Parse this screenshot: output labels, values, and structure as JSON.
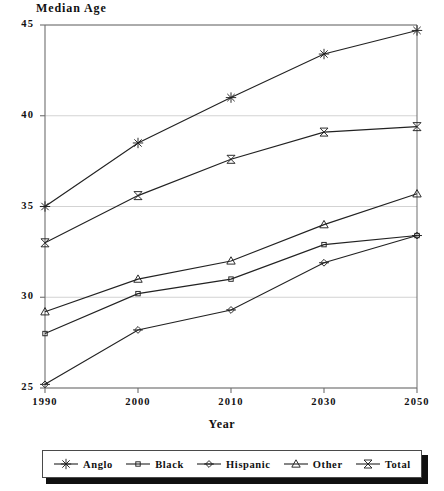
{
  "chart_data": {
    "type": "line",
    "title": "Median Age",
    "xlabel": "Year",
    "ylabel": "",
    "categories": [
      "1990",
      "2000",
      "2010",
      "2030",
      "2050"
    ],
    "ylim": [
      25,
      45
    ],
    "yticks": [
      25,
      30,
      35,
      40,
      45
    ],
    "grid": true,
    "legend_position": "bottom",
    "series": [
      {
        "name": "Anglo",
        "marker": "star",
        "values": [
          35.0,
          38.5,
          41.0,
          43.4,
          44.7
        ]
      },
      {
        "name": "Black",
        "marker": "square",
        "values": [
          28.0,
          30.2,
          31.0,
          32.9,
          33.4
        ]
      },
      {
        "name": "Hispanic",
        "marker": "diamond",
        "values": [
          25.2,
          28.2,
          29.3,
          31.9,
          33.4
        ]
      },
      {
        "name": "Other",
        "marker": "triangle",
        "values": [
          29.2,
          31.0,
          32.0,
          34.0,
          35.7
        ]
      },
      {
        "name": "Total",
        "marker": "bowtie",
        "values": [
          33.0,
          35.6,
          37.6,
          39.1,
          39.4
        ]
      }
    ]
  },
  "axes": {
    "y_tick_labels": [
      "45",
      "40",
      "35",
      "30",
      "25"
    ],
    "x_tick_labels": [
      "1990",
      "2000",
      "2010",
      "2030",
      "2050"
    ]
  },
  "legend": {
    "entries": [
      {
        "label": "Anglo"
      },
      {
        "label": "Black"
      },
      {
        "label": "Hispanic"
      },
      {
        "label": "Other"
      },
      {
        "label": "Total"
      }
    ]
  },
  "colors": {
    "line": "#222222",
    "grid": "#c8c8c8",
    "axis": "#6e6e6e",
    "text": "#111111"
  }
}
